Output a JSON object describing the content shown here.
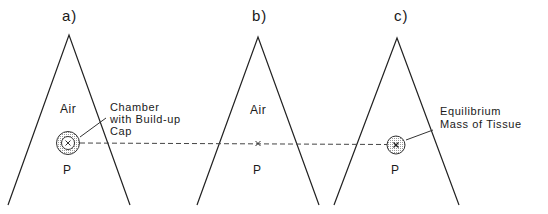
{
  "panels": [
    {
      "label": "a)",
      "air": "Air",
      "point": "P",
      "annotation": [
        "Chamber",
        "with Build-up",
        "Cap"
      ]
    },
    {
      "label": "b)",
      "air": "Air",
      "point": "P"
    },
    {
      "label": "c)",
      "point": "P",
      "annotation": [
        "Equilibrium",
        "Mass of Tissue"
      ]
    }
  ]
}
